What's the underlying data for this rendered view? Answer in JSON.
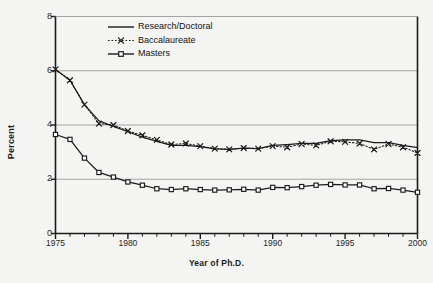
{
  "figure": {
    "background_color": "#f4f4f2",
    "ink_color": "#1b1b1b",
    "grid_color": "#9a9a9a"
  },
  "axes": {
    "ylabel": "Percent",
    "xlabel": "Year of Ph.D.",
    "yticks": [
      "0",
      "2",
      "4",
      "6",
      "8"
    ],
    "xticks": [
      "1975",
      "1980",
      "1985",
      "1990",
      "1995",
      "2000"
    ]
  },
  "legend": {
    "items": [
      {
        "label": "Research/Doctoral",
        "style": "solid-line"
      },
      {
        "label": "Baccalaureate",
        "style": "dotted-line-x-marker"
      },
      {
        "label": "Masters",
        "style": "solid-line-square-marker"
      }
    ]
  },
  "chart_data": {
    "type": "line",
    "title": "",
    "xlabel": "Year of Ph.D.",
    "ylabel": "Percent",
    "xlim": [
      1975,
      2000
    ],
    "ylim": [
      0,
      8
    ],
    "yticks": [
      0,
      2,
      4,
      6,
      8
    ],
    "xticks": [
      1975,
      1980,
      1985,
      1990,
      1995,
      2000
    ],
    "grid": "horizontal-major",
    "legend_position": "upper-center-left",
    "x": [
      1975,
      1976,
      1977,
      1978,
      1979,
      1980,
      1981,
      1982,
      1983,
      1984,
      1985,
      1986,
      1987,
      1988,
      1989,
      1990,
      1991,
      1992,
      1993,
      1994,
      1995,
      1996,
      1997,
      1998,
      1999,
      2000
    ],
    "series": [
      {
        "name": "Research/Doctoral",
        "marker": "none",
        "linestyle": "solid",
        "values": [
          6.05,
          5.65,
          4.75,
          4.15,
          3.95,
          3.75,
          3.55,
          3.4,
          3.25,
          3.25,
          3.2,
          3.12,
          3.1,
          3.15,
          3.13,
          3.25,
          3.28,
          3.32,
          3.32,
          3.42,
          3.45,
          3.45,
          3.35,
          3.35,
          3.25,
          3.17
        ]
      },
      {
        "name": "Baccalaureate",
        "marker": "x",
        "linestyle": "dotted",
        "values": [
          6.05,
          5.65,
          4.75,
          4.05,
          4.0,
          3.78,
          3.62,
          3.45,
          3.28,
          3.32,
          3.22,
          3.13,
          3.1,
          3.15,
          3.13,
          3.22,
          3.18,
          3.3,
          3.25,
          3.4,
          3.38,
          3.32,
          3.1,
          3.3,
          3.18,
          2.97
        ]
      },
      {
        "name": "Masters",
        "marker": "square",
        "linestyle": "solid",
        "values": [
          3.65,
          3.47,
          2.78,
          2.25,
          2.08,
          1.9,
          1.78,
          1.65,
          1.62,
          1.65,
          1.62,
          1.6,
          1.61,
          1.63,
          1.6,
          1.7,
          1.69,
          1.73,
          1.78,
          1.81,
          1.79,
          1.79,
          1.65,
          1.66,
          1.6,
          1.52
        ]
      }
    ]
  }
}
